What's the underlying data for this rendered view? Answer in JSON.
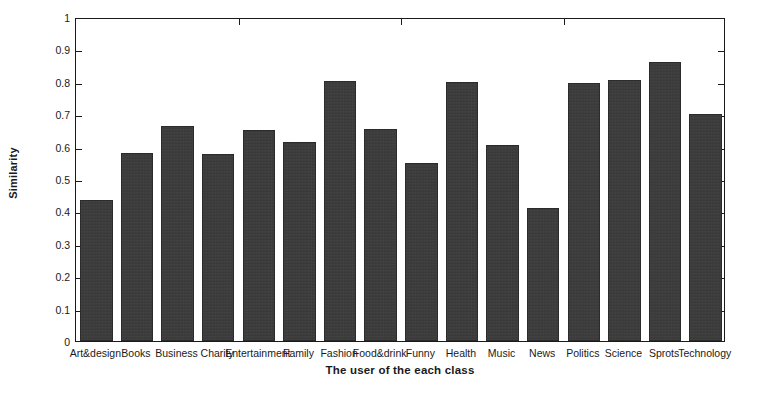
{
  "chart_data": {
    "type": "bar",
    "title": "",
    "xlabel": "The user of the each class",
    "ylabel": "Similarity",
    "ylim": [
      0,
      1
    ],
    "yticks": [
      "0",
      "0.1",
      "0.2",
      "0.3",
      "0.4",
      "0.5",
      "0.6",
      "0.7",
      "0.8",
      "0.9",
      "1"
    ],
    "grid": false,
    "legend": null,
    "bar_color": "#3a3a3a",
    "categories": [
      "Art&design",
      "Books",
      "Business",
      "Charity",
      "Entertainment",
      "Family",
      "Fashion",
      "Food&drink",
      "Funny",
      "Health",
      "Music",
      "News",
      "Politics",
      "Science",
      "Sprots",
      "Technology"
    ],
    "values": [
      0.435,
      0.58,
      0.665,
      0.578,
      0.652,
      0.615,
      0.803,
      0.655,
      0.548,
      0.8,
      0.605,
      0.41,
      0.797,
      0.806,
      0.86,
      0.7
    ]
  }
}
